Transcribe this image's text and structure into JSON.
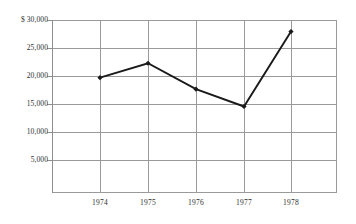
{
  "chart_data": {
    "type": "line",
    "title": "",
    "subtitle": "",
    "xlabel": "",
    "ylabel": "",
    "categories": [
      "1974",
      "1975",
      "1976",
      "1977",
      "1978"
    ],
    "values": [
      20000,
      22500,
      18000,
      15000,
      28000
    ],
    "series": [
      {
        "name": "",
        "values": [
          20000,
          22500,
          18000,
          15000,
          28000
        ]
      }
    ],
    "ylim": [
      0,
      30000
    ],
    "ytick_values": [
      30000,
      25000,
      20000,
      15000,
      10000,
      5000
    ],
    "ytick_labels": [
      "$ 30,000",
      "25,000",
      "20,000",
      "15,000",
      "10,000",
      "5,000"
    ],
    "xtick_labels": [
      "1974",
      "1975",
      "1976",
      "1977",
      "1978"
    ],
    "grid": true,
    "grid_axis": "both",
    "legend": false,
    "legend_position": "none",
    "marker": "diamond",
    "line_color": "#1a1a1a",
    "marker_color": "#1a1a1a",
    "grid_color": "#9a9a9a",
    "text_color": "#2e2e2e",
    "background_color": "#ffffff",
    "annotations": []
  },
  "axis": {
    "y_ticks": [
      {
        "label": "$ 30,000",
        "value": 30000
      },
      {
        "label": "25,000",
        "value": 25000
      },
      {
        "label": "20,000",
        "value": 20000
      },
      {
        "label": "15,000",
        "value": 15000
      },
      {
        "label": "10,000",
        "value": 10000
      },
      {
        "label": "5,000",
        "value": 5000
      }
    ],
    "x_ticks": [
      {
        "label": "1974"
      },
      {
        "label": "1975"
      },
      {
        "label": "1976"
      },
      {
        "label": "1977"
      },
      {
        "label": "1978"
      }
    ]
  }
}
